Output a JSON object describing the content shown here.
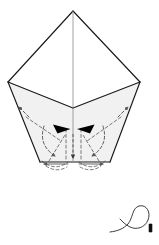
{
  "figure": {
    "kind": "origami-fold-diagram",
    "title": "Origami folding step diagram",
    "background_color": "#ffffff",
    "line_color": "#1a1a1a",
    "paper_fill_upper": "#ffffff",
    "paper_fill_lower": "#f1f1f1",
    "fold_line_color": "#555555",
    "arrow_fill": "#000000",
    "canvas": {
      "width": 159,
      "height": 245
    }
  },
  "shapes": {
    "upper_diamond": {
      "name": "upper-kite-panel",
      "points": "73,11 140,82 73,108 8,82",
      "fill": "#ffffff"
    },
    "left_lower_panel": {
      "name": "lower-left-panel",
      "points": "8,82 73,108 73,162 40,162",
      "fill": "#f1f1f1"
    },
    "right_lower_panel": {
      "name": "lower-right-panel",
      "points": "140,82 110,162 73,162 73,108",
      "fill": "#f1f1f1"
    },
    "center_vertical_crease": {
      "name": "center-crease",
      "x1": 73,
      "y1": 11,
      "x2": 73,
      "y2": 162
    }
  },
  "fold_marks": {
    "left_valley_fold": {
      "name": "left-valley-fold",
      "d": "M 27,118 L 60,140"
    },
    "right_valley_fold": {
      "name": "right-valley-fold",
      "d": "M 120,118 L 88,140"
    },
    "left_inner_fold": {
      "name": "left-inner-fold",
      "d": "M 48,161 L 64,136"
    },
    "right_inner_fold": {
      "name": "right-inner-fold",
      "d": "M 100,161 L 84,136"
    },
    "left_hidden_edge": {
      "name": "left-hidden-edge",
      "d": "M 66,130 L 66,161"
    },
    "right_hidden_edge": {
      "name": "right-hidden-edge",
      "d": "M 81,130 L 81,161"
    },
    "left_bottom_flap": {
      "name": "left-bottom-flap-outline",
      "d": "M 43,161 Q 56,172 69,161"
    },
    "right_bottom_flap": {
      "name": "right-bottom-flap-outline",
      "d": "M 78,161 Q 91,172 104,161"
    }
  },
  "arrows": {
    "left_inward_arrow": {
      "name": "left-inward-arrow",
      "label": "fold left flap in",
      "tip_x": 70,
      "tip_y": 129
    },
    "right_inward_arrow": {
      "name": "right-inward-arrow",
      "label": "fold right flap in",
      "tip_x": 77,
      "tip_y": 129
    },
    "left_curved_motion": {
      "name": "left-curved-motion-arrow",
      "label": "rotate left flap inward"
    },
    "right_curved_motion": {
      "name": "right-curved-motion-arrow",
      "label": "rotate right flap inward"
    },
    "left_upward_hint": {
      "name": "left-upward-hint-arrow",
      "label": "lift left edge"
    },
    "right_upward_hint": {
      "name": "right-upward-hint-arrow",
      "label": "lift right edge"
    },
    "center_down_arrow": {
      "name": "center-down-arrow",
      "label": "press down at center"
    },
    "bottom_left_spread": {
      "name": "bottom-left-spread-arrow",
      "label": "spread left"
    },
    "bottom_right_spread": {
      "name": "bottom-right-spread-arrow",
      "label": "spread right"
    }
  },
  "symbols": {
    "repeat_loop": {
      "name": "repeat-loop-symbol",
      "label": "repeat on the other side",
      "loop_center_x": 135,
      "loop_center_y": 218,
      "loop_radius": 12
    }
  }
}
